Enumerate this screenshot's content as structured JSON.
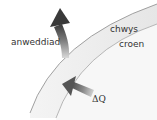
{
  "diagram": {
    "labels": {
      "evaporation": "anweddiad",
      "sweat": "chwys",
      "skin": "croen",
      "heat_flow": "ΔQ"
    },
    "arrows": [
      {
        "name": "evaporation-arrow",
        "direction": "up-left, curving outward from sweat layer"
      },
      {
        "name": "heat-flow-arrow",
        "direction": "up-left, pointing into skin layer"
      }
    ],
    "layers": [
      {
        "name": "sweat-layer",
        "label": "chwys"
      },
      {
        "name": "skin-layer",
        "label": "croen"
      }
    ],
    "colors": {
      "band_fill": "#ececec",
      "curve_stroke": "#8a8a8a",
      "arrow_dark": "#444444",
      "arrow_light": "#cfcfcf",
      "text": "#333333"
    }
  }
}
